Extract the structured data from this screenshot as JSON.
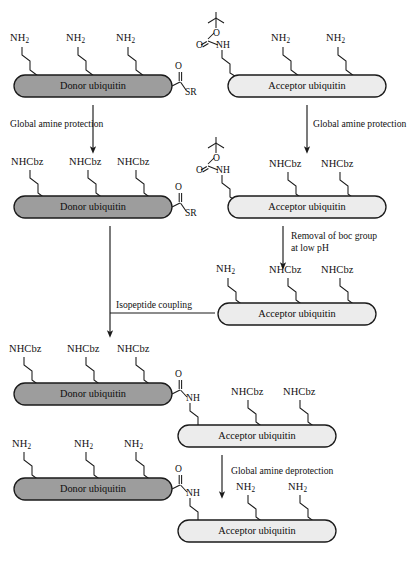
{
  "figure": {
    "type": "reaction-scheme",
    "entities": {
      "donor": "Donor ubiquitin",
      "acceptor": "Acceptor ubiquitin"
    },
    "groups": {
      "free_amine": "NH2",
      "free_amine_html": "NH<sub>2</sub>",
      "cbz_protected": "NHCbz",
      "boc_nh": "NH",
      "thioester": "SR",
      "oxygen": "O",
      "amide_nh": "NH"
    },
    "colors": {
      "donor_fill": "#9d9d9d",
      "acceptor_fill": "#ececec",
      "stroke": "#1a1a1a",
      "background": "#ffffff",
      "text": "#111111"
    },
    "steps": [
      {
        "id": "step-1",
        "label": "Global amine protection"
      },
      {
        "id": "step-2",
        "label": "Global amine protection"
      },
      {
        "id": "step-3",
        "label": "Removal of boc group",
        "label_line2": "at low pH"
      },
      {
        "id": "step-4",
        "label": "Isopeptide coupling"
      },
      {
        "id": "step-5",
        "label": "Global amine deprotection"
      }
    ],
    "rows": [
      {
        "id": "row-1",
        "left": {
          "entity": "Donor ubiquitin",
          "sidechains": [
            "NH2",
            "NH2",
            "NH2"
          ],
          "c_terminus": "SR thioester"
        },
        "right": {
          "entity": "Acceptor ubiquitin",
          "sidechains": [
            "Boc-NH",
            "NH2",
            "NH2"
          ]
        }
      },
      {
        "id": "row-2",
        "left": {
          "entity": "Donor ubiquitin",
          "sidechains": [
            "NHCbz",
            "NHCbz",
            "NHCbz"
          ],
          "c_terminus": "SR thioester"
        },
        "right": {
          "entity": "Acceptor ubiquitin",
          "sidechains": [
            "Boc-NH",
            "NHCbz",
            "NHCbz"
          ]
        }
      },
      {
        "id": "row-3",
        "right": {
          "entity": "Acceptor ubiquitin",
          "sidechains": [
            "NH2",
            "NHCbz",
            "NHCbz"
          ]
        }
      },
      {
        "id": "row-4",
        "conjugate": {
          "donor": "Donor ubiquitin",
          "acceptor": "Acceptor ubiquitin",
          "donor_sidechains": [
            "NHCbz",
            "NHCbz",
            "NHCbz"
          ],
          "acceptor_sidechains": [
            "NHCbz",
            "NHCbz"
          ],
          "linkage": "isopeptide amide"
        }
      },
      {
        "id": "row-5",
        "conjugate": {
          "donor": "Donor ubiquitin",
          "acceptor": "Acceptor ubiquitin",
          "donor_sidechains": [
            "NH2",
            "NH2",
            "NH2"
          ],
          "acceptor_sidechains": [
            "NH2",
            "NH2"
          ],
          "linkage": "isopeptide amide"
        }
      }
    ]
  }
}
